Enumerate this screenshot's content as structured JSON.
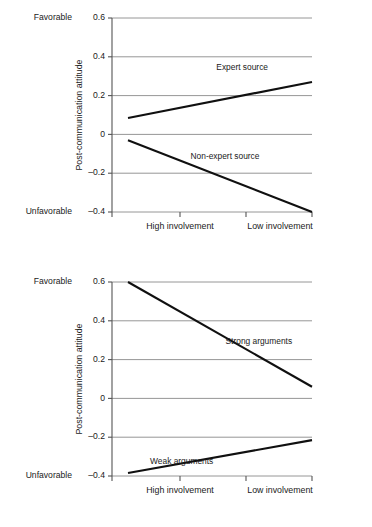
{
  "figure": {
    "background_color": "#ffffff",
    "line_color": "#101010",
    "grid_color": "#8a8a8a",
    "axis_color": "#555555"
  },
  "chart_data": [
    {
      "type": "line",
      "panel": "top",
      "title": "",
      "xlabel": "",
      "ylabel": "Post-communication attitude",
      "categories": [
        "High involvement",
        "Low involvement"
      ],
      "x": [
        0,
        1
      ],
      "ylim": [
        -0.4,
        0.6
      ],
      "yticks": [
        0.6,
        0.4,
        0.2,
        0,
        -0.2,
        -0.4
      ],
      "ytick_labels": [
        "0.6",
        "0.4",
        "0.2",
        "0",
        "–0.2",
        "–0.4"
      ],
      "y_axis_high_anchor": "Favorable",
      "y_axis_low_anchor": "Unfavorable",
      "grid": true,
      "legend": "inline-labels",
      "series": [
        {
          "name": "Expert source",
          "values": [
            0.085,
            0.27
          ],
          "label_x": 0.48,
          "label_y": 0.345
        },
        {
          "name": "Non-expert source",
          "values": [
            -0.03,
            -0.4
          ],
          "label_x": 0.34,
          "label_y": -0.115
        }
      ]
    },
    {
      "type": "line",
      "panel": "bottom",
      "title": "",
      "xlabel": "",
      "ylabel": "Post-communication attitude",
      "categories": [
        "High involvement",
        "Low involvement"
      ],
      "x": [
        0,
        1
      ],
      "ylim": [
        -0.4,
        0.6
      ],
      "yticks": [
        0.6,
        0.4,
        0.2,
        0,
        -0.2,
        -0.4
      ],
      "ytick_labels": [
        "0.6",
        "0.4",
        "0.2",
        "0",
        "–0.2",
        "–0.4"
      ],
      "y_axis_high_anchor": "Favorable",
      "y_axis_low_anchor": "Unfavorable",
      "grid": true,
      "legend": "inline-labels",
      "series": [
        {
          "name": "Strong arguments",
          "values": [
            0.6,
            0.06
          ],
          "label_x": 0.53,
          "label_y": 0.29
        },
        {
          "name": "Weak arguments",
          "values": [
            -0.385,
            -0.215
          ],
          "label_x": 0.12,
          "label_y": -0.325
        }
      ]
    }
  ]
}
